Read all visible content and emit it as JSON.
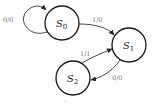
{
  "diagram": {
    "type": "state-machine",
    "states": [
      {
        "id": "S0",
        "name": "S",
        "sub": "0",
        "cx": 62,
        "cy": 23,
        "r": 17
      },
      {
        "id": "S1",
        "name": "S",
        "sub": "1",
        "cx": 129,
        "cy": 45,
        "r": 17
      },
      {
        "id": "S2",
        "name": "S",
        "sub": "2",
        "cx": 73,
        "cy": 78,
        "r": 17
      }
    ],
    "transitions": [
      {
        "from": "S0",
        "to": "S0",
        "label": "0/0"
      },
      {
        "from": "S0",
        "to": "S1",
        "label": "1/0"
      },
      {
        "from": "S2",
        "to": "S1",
        "label": "1/1"
      },
      {
        "from": "S1",
        "to": "S2",
        "label": "0/0"
      }
    ],
    "colors": {
      "stroke": "#1a1a1a",
      "label": "#777777",
      "background": "#ffffff"
    }
  }
}
